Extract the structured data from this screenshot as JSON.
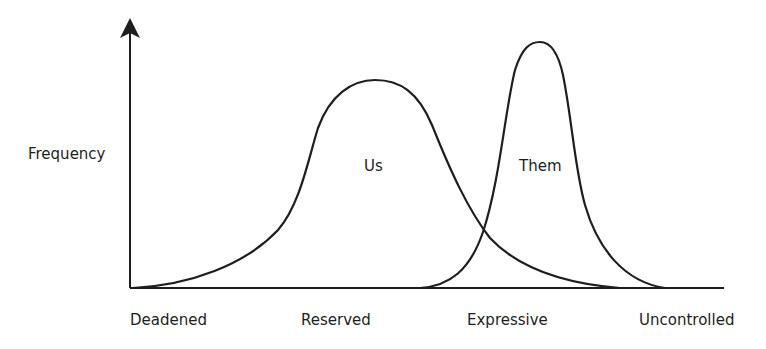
{
  "diagram": {
    "y_axis_label": "Frequency",
    "x_axis_labels": [
      "Deadened",
      "Reserved",
      "Expressive",
      "Uncontrolled"
    ],
    "curves": [
      {
        "name": "Us",
        "label": "Us"
      },
      {
        "name": "Them",
        "label": "Them"
      }
    ],
    "line_color": "#1e1e1e"
  }
}
